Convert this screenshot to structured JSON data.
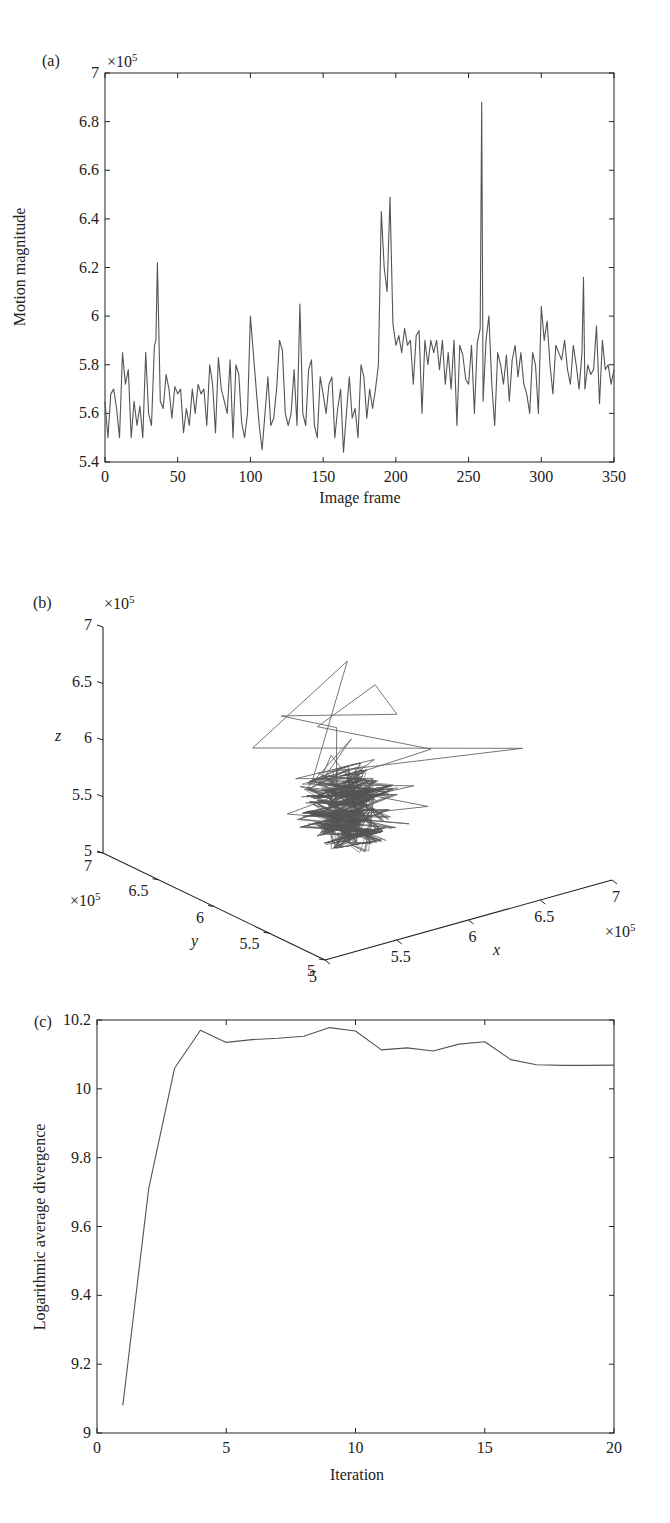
{
  "chart_data": [
    {
      "panel": "(a)",
      "type": "line",
      "title": "",
      "xlabel": "Image frame",
      "ylabel": "Motion magnitude",
      "y_multiplier": "×10^5",
      "xlim": [
        0,
        350
      ],
      "ylim": [
        5.4,
        7
      ],
      "xticks": [
        0,
        50,
        100,
        150,
        200,
        250,
        300,
        350
      ],
      "yticks": [
        5.4,
        5.6,
        5.8,
        6,
        6.2,
        6.4,
        6.6,
        6.8,
        7
      ],
      "grid": false,
      "series": [
        {
          "name": "motion magnitude",
          "color": "#555555",
          "x": [
            0,
            2,
            4,
            6,
            8,
            10,
            12,
            14,
            16,
            18,
            20,
            22,
            24,
            26,
            28,
            30,
            32,
            34,
            35,
            36,
            38,
            40,
            42,
            44,
            46,
            48,
            50,
            52,
            54,
            56,
            58,
            60,
            62,
            64,
            66,
            68,
            70,
            72,
            74,
            76,
            78,
            80,
            82,
            84,
            86,
            88,
            90,
            92,
            94,
            96,
            98,
            100,
            102,
            104,
            106,
            108,
            110,
            112,
            114,
            116,
            118,
            120,
            122,
            124,
            126,
            128,
            130,
            132,
            134,
            136,
            138,
            140,
            142,
            144,
            146,
            148,
            150,
            152,
            154,
            156,
            158,
            160,
            162,
            164,
            166,
            168,
            170,
            172,
            174,
            176,
            178,
            180,
            182,
            184,
            186,
            188,
            190,
            192,
            194,
            196,
            198,
            200,
            202,
            204,
            206,
            208,
            210,
            212,
            214,
            216,
            218,
            220,
            222,
            224,
            226,
            228,
            230,
            232,
            234,
            236,
            238,
            240,
            242,
            244,
            246,
            248,
            250,
            252,
            254,
            256,
            258,
            259,
            260,
            262,
            264,
            266,
            268,
            270,
            272,
            274,
            276,
            278,
            280,
            282,
            284,
            286,
            288,
            290,
            292,
            294,
            296,
            298,
            300,
            302,
            304,
            306,
            308,
            310,
            312,
            314,
            316,
            318,
            320,
            322,
            324,
            326,
            328,
            329,
            330,
            332,
            334,
            336,
            338,
            340,
            342,
            344,
            346,
            348,
            350
          ],
          "y": [
            5.65,
            5.5,
            5.68,
            5.7,
            5.62,
            5.5,
            5.85,
            5.72,
            5.78,
            5.5,
            5.65,
            5.55,
            5.63,
            5.5,
            5.85,
            5.6,
            5.55,
            5.88,
            5.9,
            6.22,
            5.65,
            5.62,
            5.76,
            5.7,
            5.58,
            5.71,
            5.68,
            5.7,
            5.52,
            5.62,
            5.55,
            5.7,
            5.6,
            5.72,
            5.68,
            5.7,
            5.55,
            5.8,
            5.72,
            5.52,
            5.83,
            5.7,
            5.65,
            5.6,
            5.82,
            5.5,
            5.8,
            5.76,
            5.56,
            5.5,
            5.6,
            6.0,
            5.85,
            5.7,
            5.55,
            5.45,
            5.6,
            5.75,
            5.55,
            5.58,
            5.7,
            5.9,
            5.86,
            5.6,
            5.55,
            5.6,
            5.78,
            5.55,
            6.05,
            5.6,
            5.55,
            5.78,
            5.82,
            5.55,
            5.5,
            5.75,
            5.68,
            5.6,
            5.72,
            5.75,
            5.5,
            5.62,
            5.7,
            5.44,
            5.6,
            5.75,
            5.58,
            5.62,
            5.5,
            5.8,
            5.75,
            5.58,
            5.7,
            5.62,
            5.7,
            5.8,
            6.43,
            6.2,
            6.1,
            6.49,
            5.97,
            5.88,
            5.92,
            5.85,
            5.95,
            5.88,
            5.9,
            5.72,
            5.92,
            5.94,
            5.6,
            5.9,
            5.8,
            5.9,
            5.85,
            5.9,
            5.78,
            5.9,
            5.72,
            5.85,
            5.7,
            5.9,
            5.55,
            5.88,
            5.84,
            5.74,
            5.72,
            5.88,
            5.6,
            5.89,
            5.95,
            6.88,
            5.65,
            5.9,
            6.0,
            5.72,
            5.55,
            5.85,
            5.8,
            5.72,
            5.84,
            5.65,
            5.82,
            5.88,
            5.75,
            5.85,
            5.72,
            5.68,
            5.6,
            5.85,
            5.8,
            5.6,
            6.04,
            5.9,
            5.98,
            5.8,
            5.68,
            5.88,
            5.85,
            5.82,
            5.9,
            5.78,
            5.72,
            5.88,
            5.8,
            5.7,
            5.85,
            6.16,
            5.7,
            5.8,
            5.76,
            5.78,
            5.96,
            5.64,
            5.9,
            5.78,
            5.8,
            5.72,
            5.78
          ]
        }
      ]
    },
    {
      "panel": "(b)",
      "type": "line",
      "subtype": "3d-phase-space",
      "title": "",
      "xlabel": "x",
      "ylabel": "y",
      "zlabel": "z",
      "x_multiplier": "×10^5",
      "y_multiplier": "×10^5",
      "z_multiplier": "×10^5",
      "xlim": [
        5,
        7
      ],
      "ylim": [
        5,
        7
      ],
      "zlim": [
        5,
        7
      ],
      "xticks": [
        5,
        5.5,
        6,
        6.5,
        7
      ],
      "yticks": [
        5,
        5.5,
        6,
        6.5,
        7
      ],
      "zticks": [
        5,
        5.5,
        6,
        6.5,
        7
      ],
      "grid": false,
      "description": "Reconstructed phase-space trajectory of motion magnitude; dense cluster near (5.7, 5.7, 5.7)×10^5 with large excursions up to ~6.9×10^5"
    },
    {
      "panel": "(c)",
      "type": "line",
      "title": "",
      "xlabel": "Iteration",
      "ylabel": "Logarithmic average divergence",
      "xlim": [
        0,
        20
      ],
      "ylim": [
        9,
        10.2
      ],
      "xticks": [
        0,
        5,
        10,
        15,
        20
      ],
      "yticks": [
        9,
        9.2,
        9.4,
        9.6,
        9.8,
        10,
        10.2
      ],
      "grid": false,
      "series": [
        {
          "name": "log average divergence",
          "color": "#555555",
          "x": [
            1,
            2,
            3,
            4,
            5,
            6,
            7,
            8,
            9,
            10,
            11,
            12,
            13,
            14,
            15,
            16,
            17,
            18,
            19,
            20
          ],
          "y": [
            9.08,
            9.71,
            10.06,
            10.17,
            10.135,
            10.143,
            10.147,
            10.153,
            10.178,
            10.168,
            10.113,
            10.119,
            10.11,
            10.13,
            10.137,
            10.085,
            10.07,
            10.068,
            10.068,
            10.069
          ]
        }
      ]
    }
  ],
  "panels": {
    "a": {
      "tag": "(a)",
      "multiplier_base": "×10",
      "multiplier_exp": "5",
      "xlabel": "Image frame",
      "ylabel": "Motion magnitude",
      "xticks": [
        "0",
        "50",
        "100",
        "150",
        "200",
        "250",
        "300",
        "350"
      ],
      "yticks": [
        "5.4",
        "5.6",
        "5.8",
        "6",
        "6.2",
        "6.4",
        "6.6",
        "6.8",
        "7"
      ]
    },
    "b": {
      "tag": "(b)",
      "multiplier_base": "×10",
      "multiplier_exp": "5",
      "xlabel": "x",
      "ylabel": "y",
      "zlabel": "z",
      "zticks": [
        "7",
        "6.5",
        "6",
        "5.5",
        "5"
      ],
      "yticks": [
        "7",
        "6.5",
        "6",
        "5.5",
        "5"
      ],
      "xticks": [
        "5",
        "5.5",
        "6",
        "6.5",
        "7"
      ]
    },
    "c": {
      "tag": "(c)",
      "xlabel": "Iteration",
      "ylabel": "Logarithmic average divergence",
      "xticks": [
        "0",
        "5",
        "10",
        "15",
        "20"
      ],
      "yticks": [
        "9",
        "9.2",
        "9.4",
        "9.6",
        "9.8",
        "10",
        "10.2"
      ]
    }
  },
  "caption": {
    "visible_text": "",
    "note": "partially cut-off caption line, illegible"
  },
  "colors": {
    "line": "#555555",
    "axis": "#222222",
    "background": "#ffffff"
  }
}
